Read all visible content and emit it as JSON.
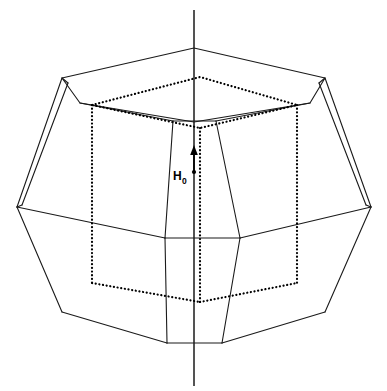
{
  "figure": {
    "background_color": "#ffffff",
    "width": 387,
    "height": 391
  },
  "chart_data": {
    "type": "diagram",
    "title": "",
    "xlabel": "",
    "ylabel": "",
    "annotations": [
      {
        "name": "field-vector",
        "label": "H",
        "subscript": "0",
        "full_text": "H0",
        "direction": "up",
        "tail": [
          200,
          172
        ],
        "tip": [
          200,
          147
        ]
      }
    ]
  },
  "labels": {
    "field_symbol": "H",
    "field_subscript": "0"
  },
  "colors": {
    "stroke": "#1a1a1a",
    "dotted": "#000000",
    "background": "#ffffff",
    "label": "#000000"
  },
  "geometry": {
    "axis": {
      "name": "symmetry-axis",
      "x1": 194,
      "y1": 10,
      "x2": 194,
      "y2": 386
    },
    "solid_polylines": [
      {
        "name": "top-face-hexagon",
        "points": "62,78 194,48 325,78 310,103 194,122 80,103 62,78"
      },
      {
        "name": "upper-left-long-edge",
        "points": "62,78 17,207"
      },
      {
        "name": "upper-left-inner-edge",
        "points": "68,83 22,205"
      },
      {
        "name": "upper-left-facet-cap",
        "points": "62,78 68,83"
      },
      {
        "name": "upper-right-long-edge",
        "points": "325,78 371,207"
      },
      {
        "name": "upper-right-inner-edge",
        "points": "319,83 366,205"
      },
      {
        "name": "upper-right-facet-cap",
        "points": "325,78 319,83"
      },
      {
        "name": "equator-front-left",
        "points": "17,207 165,238"
      },
      {
        "name": "equator-front-center",
        "points": "165,238 240,238"
      },
      {
        "name": "equator-front-right",
        "points": "240,238 371,207"
      },
      {
        "name": "left-belt-vertex-to-upper",
        "points": "17,207 22,205"
      },
      {
        "name": "right-belt-vertex-to-upper",
        "points": "371,207 366,205"
      },
      {
        "name": "lower-left-edge",
        "points": "17,207 62,312"
      },
      {
        "name": "lower-right-edge",
        "points": "371,207 325,312"
      },
      {
        "name": "bottom-left-edge",
        "points": "62,312 167,343"
      },
      {
        "name": "bottom-front-edge",
        "points": "167,343 222,343"
      },
      {
        "name": "bottom-right-edge",
        "points": "222,343 325,312"
      },
      {
        "name": "front-facet-left-upper",
        "points": "173,121 165,238"
      },
      {
        "name": "front-facet-right-upper",
        "points": "216,121 240,238"
      },
      {
        "name": "front-facet-top-edge",
        "points": "173,121 216,121"
      },
      {
        "name": "front-facet-left-lower",
        "points": "165,238 167,343"
      },
      {
        "name": "front-facet-right-lower",
        "points": "240,238 222,343"
      },
      {
        "name": "top-face-front-left-ridge",
        "points": "80,103 173,121"
      },
      {
        "name": "top-face-front-right-ridge",
        "points": "310,103 216,121"
      }
    ],
    "dotted_polylines": [
      {
        "name": "cube-top-face",
        "points": "92,105 200,77 297,105 200,128 92,105"
      },
      {
        "name": "cube-left-vertical-edge",
        "points": "92,105 92,283"
      },
      {
        "name": "cube-right-vertical-edge",
        "points": "297,105 297,283"
      },
      {
        "name": "cube-front-vertical-edge",
        "points": "200,128 200,302"
      },
      {
        "name": "cube-bottom-front-left",
        "points": "92,283 200,302"
      },
      {
        "name": "cube-bottom-front-right",
        "points": "200,302 297,283"
      }
    ]
  }
}
